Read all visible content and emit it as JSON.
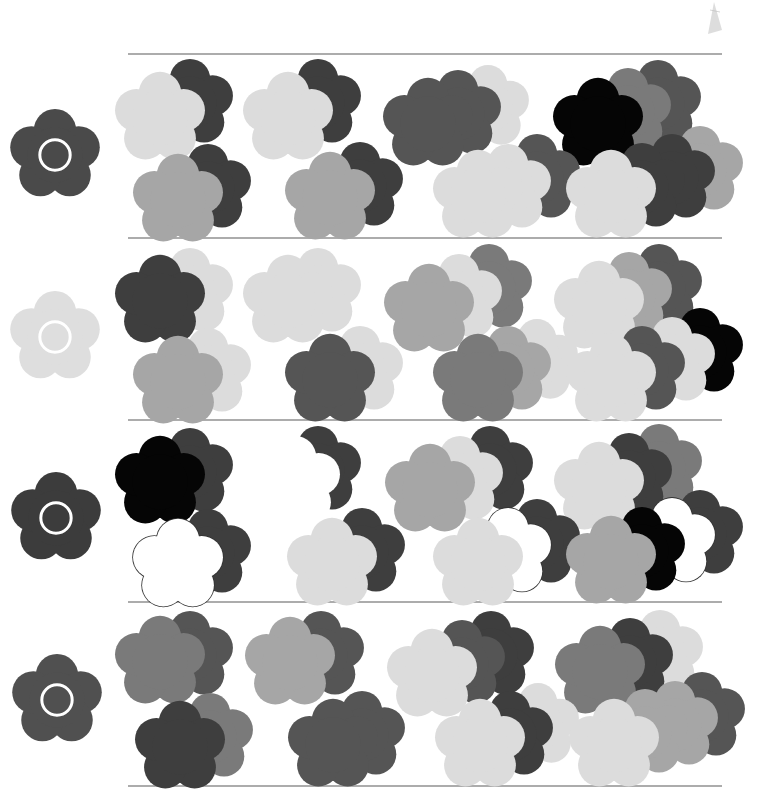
{
  "page": {
    "width": 760,
    "height": 802,
    "background": "#ffffff"
  },
  "palette": {
    "black": "#050505",
    "dark": "#3e3e3e",
    "mid_dark": "#555555",
    "mid": "#7a7a7a",
    "light_mid": "#a6a6a6",
    "light": "#dcdcdc",
    "outline": "#ffffff",
    "rule": "#5a5a5a"
  },
  "rules_y": [
    54,
    238,
    420,
    602,
    786
  ],
  "rows": [
    {
      "target": {
        "cx": 55,
        "cy": 155,
        "r": 46,
        "color": "#4a4a4a"
      },
      "groups": [
        {
          "flowers": [
            {
              "x": 160,
              "y": 118,
              "r": 22,
              "c": "light"
            },
            {
              "x": 190,
              "y": 103,
              "r": 21,
              "c": "dark"
            }
          ],
          "order": [
            1,
            0
          ]
        },
        {
          "flowers": [
            {
              "x": 288,
              "y": 118,
              "r": 22,
              "c": "light"
            },
            {
              "x": 318,
              "y": 103,
              "r": 21,
              "c": "dark"
            }
          ],
          "order": [
            1,
            0
          ]
        },
        {
          "flowers": [
            {
              "x": 428,
              "y": 124,
              "r": 22,
              "c": "mid_dark"
            },
            {
              "x": 458,
              "y": 114,
              "r": 21,
              "c": "mid_dark"
            },
            {
              "x": 488,
              "y": 107,
              "r": 20,
              "c": "light"
            }
          ],
          "order": [
            2,
            1,
            0
          ]
        },
        {
          "flowers": [
            {
              "x": 598,
              "y": 124,
              "r": 22,
              "c": "black"
            },
            {
              "x": 628,
              "y": 112,
              "r": 21,
              "c": "mid"
            },
            {
              "x": 658,
              "y": 104,
              "r": 21,
              "c": "mid_dark"
            }
          ],
          "order": [
            2,
            1,
            0
          ]
        },
        {
          "flowers": [
            {
              "x": 178,
              "y": 200,
              "r": 22,
              "c": "light_mid"
            },
            {
              "x": 208,
              "y": 188,
              "r": 21,
              "c": "dark"
            }
          ],
          "order": [
            1,
            0
          ]
        },
        {
          "flowers": [
            {
              "x": 330,
              "y": 198,
              "r": 22,
              "c": "light_mid"
            },
            {
              "x": 360,
              "y": 186,
              "r": 21,
              "c": "dark"
            }
          ],
          "order": [
            1,
            0
          ]
        },
        {
          "flowers": [
            {
              "x": 478,
              "y": 196,
              "r": 22,
              "c": "light"
            },
            {
              "x": 508,
              "y": 188,
              "r": 21,
              "c": "light"
            },
            {
              "x": 537,
              "y": 178,
              "r": 21,
              "c": "mid_dark"
            }
          ],
          "order": [
            2,
            1,
            0
          ]
        },
        {
          "flowers": [
            {
              "x": 611,
              "y": 196,
              "r": 22,
              "c": "light"
            },
            {
              "x": 642,
              "y": 187,
              "r": 21,
              "c": "dark"
            },
            {
              "x": 672,
              "y": 178,
              "r": 21,
              "c": "dark"
            },
            {
              "x": 700,
              "y": 170,
              "r": 21,
              "c": "light_mid"
            }
          ],
          "order": [
            3,
            2,
            1,
            0
          ]
        }
      ]
    },
    {
      "target": {
        "cx": 55,
        "cy": 337,
        "r": 46,
        "color": "#dedede"
      },
      "groups": [
        {
          "flowers": [
            {
              "x": 160,
              "y": 301,
              "r": 22,
              "c": "dark"
            },
            {
              "x": 190,
              "y": 292,
              "r": 21,
              "c": "light"
            }
          ],
          "order": [
            1,
            0
          ]
        },
        {
          "flowers": [
            {
              "x": 288,
              "y": 301,
              "r": 22,
              "c": "light"
            },
            {
              "x": 318,
              "y": 292,
              "r": 21,
              "c": "light"
            }
          ],
          "order": [
            1,
            0
          ]
        },
        {
          "flowers": [
            {
              "x": 429,
              "y": 310,
              "r": 22,
              "c": "light_mid"
            },
            {
              "x": 459,
              "y": 298,
              "r": 21,
              "c": "light"
            },
            {
              "x": 489,
              "y": 288,
              "r": 21,
              "c": "mid"
            }
          ],
          "order": [
            2,
            1,
            0
          ]
        },
        {
          "flowers": [
            {
              "x": 599,
              "y": 307,
              "r": 22,
              "c": "light"
            },
            {
              "x": 629,
              "y": 296,
              "r": 21,
              "c": "light_mid"
            },
            {
              "x": 659,
              "y": 288,
              "r": 21,
              "c": "mid_dark"
            }
          ],
          "order": [
            2,
            1,
            0
          ]
        },
        {
          "flowers": [
            {
              "x": 178,
              "y": 382,
              "r": 22,
              "c": "light_mid"
            },
            {
              "x": 208,
              "y": 372,
              "r": 21,
              "c": "light"
            }
          ],
          "order": [
            1,
            0
          ]
        },
        {
          "flowers": [
            {
              "x": 330,
              "y": 380,
              "r": 22,
              "c": "mid_dark"
            },
            {
              "x": 360,
              "y": 370,
              "r": 21,
              "c": "light"
            }
          ],
          "order": [
            1,
            0
          ]
        },
        {
          "flowers": [
            {
              "x": 478,
              "y": 380,
              "r": 22,
              "c": "mid"
            },
            {
              "x": 508,
              "y": 370,
              "r": 21,
              "c": "light_mid"
            },
            {
              "x": 537,
              "y": 361,
              "r": 20,
              "c": "light"
            }
          ],
          "order": [
            2,
            1,
            0
          ]
        },
        {
          "flowers": [
            {
              "x": 611,
              "y": 380,
              "r": 22,
              "c": "light"
            },
            {
              "x": 642,
              "y": 370,
              "r": 21,
              "c": "mid_dark"
            },
            {
              "x": 672,
              "y": 361,
              "r": 21,
              "c": "light"
            },
            {
              "x": 700,
              "y": 352,
              "r": 21,
              "c": "black"
            }
          ],
          "order": [
            3,
            2,
            1,
            0
          ]
        }
      ]
    },
    {
      "target": {
        "cx": 56,
        "cy": 518,
        "r": 46,
        "color": "#3c3c3c"
      },
      "groups": [
        {
          "flowers": [
            {
              "x": 160,
              "y": 482,
              "r": 22,
              "c": "black"
            },
            {
              "x": 190,
              "y": 472,
              "r": 21,
              "c": "dark"
            }
          ],
          "order": [
            1,
            0
          ]
        },
        {
          "flowers": [
            {
              "x": 295,
              "y": 482,
              "r": 22,
              "c": "white"
            },
            {
              "x": 318,
              "y": 470,
              "r": 21,
              "c": "dark"
            }
          ],
          "order": [
            1,
            0
          ]
        },
        {
          "flowers": [
            {
              "x": 430,
              "y": 490,
              "r": 22,
              "c": "light_mid"
            },
            {
              "x": 460,
              "y": 480,
              "r": 21,
              "c": "light"
            },
            {
              "x": 490,
              "y": 470,
              "r": 21,
              "c": "dark"
            }
          ],
          "order": [
            2,
            1,
            0
          ]
        },
        {
          "flowers": [
            {
              "x": 599,
              "y": 488,
              "r": 22,
              "c": "light"
            },
            {
              "x": 629,
              "y": 477,
              "r": 21,
              "c": "dark"
            },
            {
              "x": 659,
              "y": 468,
              "r": 21,
              "c": "mid"
            }
          ],
          "order": [
            2,
            1,
            0
          ]
        },
        {
          "flowers": [
            {
              "x": 178,
              "y": 565,
              "r": 22,
              "c": "outline"
            },
            {
              "x": 208,
              "y": 553,
              "r": 21,
              "c": "dark"
            }
          ],
          "order": [
            1,
            0
          ]
        },
        {
          "flowers": [
            {
              "x": 332,
              "y": 564,
              "r": 22,
              "c": "light"
            },
            {
              "x": 362,
              "y": 552,
              "r": 21,
              "c": "dark"
            }
          ],
          "order": [
            1,
            0
          ]
        },
        {
          "flowers": [
            {
              "x": 478,
              "y": 564,
              "r": 22,
              "c": "light"
            },
            {
              "x": 508,
              "y": 552,
              "r": 21,
              "c": "outline"
            },
            {
              "x": 537,
              "y": 543,
              "r": 21,
              "c": "dark"
            }
          ],
          "order": [
            2,
            1,
            0
          ]
        },
        {
          "flowers": [
            {
              "x": 611,
              "y": 562,
              "r": 22,
              "c": "light_mid"
            },
            {
              "x": 642,
              "y": 551,
              "r": 21,
              "c": "black"
            },
            {
              "x": 672,
              "y": 542,
              "r": 21,
              "c": "outline"
            },
            {
              "x": 700,
              "y": 534,
              "r": 21,
              "c": "dark"
            }
          ],
          "order": [
            3,
            2,
            1,
            0
          ]
        }
      ]
    },
    {
      "target": {
        "cx": 57,
        "cy": 700,
        "r": 46,
        "color": "#505050"
      },
      "groups": [
        {
          "flowers": [
            {
              "x": 160,
              "y": 662,
              "r": 22,
              "c": "mid"
            },
            {
              "x": 190,
              "y": 655,
              "r": 21,
              "c": "mid_dark"
            }
          ],
          "order": [
            1,
            0
          ]
        },
        {
          "flowers": [
            {
              "x": 290,
              "y": 663,
              "r": 22,
              "c": "light_mid"
            },
            {
              "x": 321,
              "y": 655,
              "r": 21,
              "c": "mid_dark"
            }
          ],
          "order": [
            1,
            0
          ]
        },
        {
          "flowers": [
            {
              "x": 432,
              "y": 675,
              "r": 22,
              "c": "light"
            },
            {
              "x": 462,
              "y": 664,
              "r": 21,
              "c": "mid_dark"
            },
            {
              "x": 491,
              "y": 655,
              "r": 21,
              "c": "dark"
            }
          ],
          "order": [
            2,
            1,
            0
          ]
        },
        {
          "flowers": [
            {
              "x": 600,
              "y": 672,
              "r": 22,
              "c": "mid"
            },
            {
              "x": 630,
              "y": 662,
              "r": 21,
              "c": "dark"
            },
            {
              "x": 660,
              "y": 654,
              "r": 21,
              "c": "light"
            }
          ],
          "order": [
            2,
            1,
            0
          ]
        },
        {
          "flowers": [
            {
              "x": 180,
              "y": 747,
              "r": 22,
              "c": "dark"
            },
            {
              "x": 210,
              "y": 737,
              "r": 21,
              "c": "mid"
            }
          ],
          "order": [
            1,
            0
          ]
        },
        {
          "flowers": [
            {
              "x": 333,
              "y": 745,
              "r": 22,
              "c": "mid_dark"
            },
            {
              "x": 362,
              "y": 735,
              "r": 21,
              "c": "mid_dark"
            }
          ],
          "order": [
            1,
            0
          ]
        },
        {
          "flowers": [
            {
              "x": 480,
              "y": 745,
              "r": 22,
              "c": "light"
            },
            {
              "x": 510,
              "y": 735,
              "r": 21,
              "c": "dark"
            },
            {
              "x": 538,
              "y": 725,
              "r": 20,
              "c": "light"
            }
          ],
          "order": [
            2,
            1,
            0
          ]
        },
        {
          "flowers": [
            {
              "x": 614,
              "y": 745,
              "r": 22,
              "c": "light"
            },
            {
              "x": 645,
              "y": 733,
              "r": 21,
              "c": "light_mid"
            },
            {
              "x": 675,
              "y": 725,
              "r": 21,
              "c": "light_mid"
            },
            {
              "x": 702,
              "y": 716,
              "r": 21,
              "c": "mid_dark"
            }
          ],
          "order": [
            3,
            2,
            1,
            0
          ]
        }
      ]
    }
  ]
}
